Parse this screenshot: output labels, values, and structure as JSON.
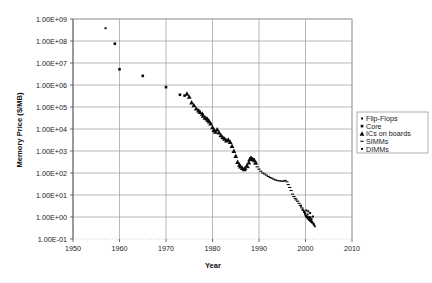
{
  "chart_data": {
    "type": "scatter",
    "title": "",
    "xlabel": "Year",
    "ylabel": "Memory Price ($/MB)",
    "xlim": [
      1950,
      2010
    ],
    "ylim": [
      0.1,
      1000000000
    ],
    "yscale": "log",
    "grid": true,
    "legend_position": "right",
    "x_ticks": [
      "1950",
      "1960",
      "1970",
      "1980",
      "1990",
      "2000",
      "2010"
    ],
    "x_tick_values": [
      1950,
      1960,
      1970,
      1980,
      1990,
      2000,
      2010
    ],
    "y_ticks": [
      "1.00E+09",
      "1.00E+08",
      "1.00E+07",
      "1.00E+06",
      "1.00E+05",
      "1.00E+04",
      "1.00E+03",
      "1.00E+02",
      "1.00E+01",
      "1.00E+00",
      "1.00E-01"
    ],
    "y_tick_values": [
      1000000000,
      100000000,
      10000000,
      1000000,
      100000,
      10000,
      1000,
      100,
      10,
      1,
      0.1
    ],
    "series": [
      {
        "name": "Flip-Flops",
        "marker": "small-square",
        "color": "#0a0a0a",
        "points": [
          [
            1957.0,
            380000000.0
          ]
        ]
      },
      {
        "name": "Core",
        "marker": "square",
        "color": "#0a0a0a",
        "points": [
          [
            1959.0,
            75000000.0
          ],
          [
            1960.0,
            5200000.0
          ],
          [
            1965.0,
            2600000.0
          ],
          [
            1970.0,
            800000.0
          ],
          [
            1973.0,
            360000.0
          ],
          [
            1974.0,
            330000.0
          ]
        ]
      },
      {
        "name": "ICs on boards",
        "marker": "triangle",
        "color": "#0a0a0a",
        "points": [
          [
            1974.5,
            400000.0
          ],
          [
            1975.0,
            290000.0
          ],
          [
            1975.5,
            160000.0
          ],
          [
            1976.0,
            120000.0
          ],
          [
            1976.5,
            85000.0
          ],
          [
            1977.0,
            70000.0
          ],
          [
            1977.3,
            60000.0
          ],
          [
            1977.8,
            50000.0
          ],
          [
            1978.0,
            40000.0
          ],
          [
            1978.4,
            33000.0
          ],
          [
            1978.8,
            30000.0
          ],
          [
            1979.0,
            26000.0
          ],
          [
            1979.3,
            22000.0
          ],
          [
            1979.6,
            18000.0
          ],
          [
            1980.0,
            12000.0
          ],
          [
            1980.3,
            9000.0
          ],
          [
            1980.6,
            7500.0
          ],
          [
            1981.0,
            9500.0
          ],
          [
            1981.4,
            7000.0
          ],
          [
            1981.8,
            5200.0
          ],
          [
            1982.2,
            4200.0
          ],
          [
            1982.6,
            3600.0
          ],
          [
            1983.0,
            3000.0
          ],
          [
            1983.4,
            3300.0
          ],
          [
            1983.8,
            2600.0
          ],
          [
            1984.2,
            1700.0
          ],
          [
            1984.6,
            1000.0
          ],
          [
            1985.0,
            600.0
          ],
          [
            1985.4,
            320.0
          ],
          [
            1985.8,
            240.0
          ],
          [
            1986.0,
            200.0
          ],
          [
            1986.4,
            170.0
          ],
          [
            1986.8,
            150.0
          ],
          [
            1987.0,
            165.0
          ],
          [
            1987.4,
            220.0
          ],
          [
            1987.8,
            300.0
          ],
          [
            1988.0,
            420.0
          ],
          [
            1988.3,
            500.0
          ],
          [
            1988.6,
            430.0
          ],
          [
            1989.0,
            380.0
          ],
          [
            1989.3,
            300.0
          ]
        ]
      },
      {
        "name": "SIMMs",
        "marker": "dash",
        "color": "#0a0a0a",
        "points": [
          [
            1987.6,
            175.0
          ],
          [
            1988.2,
            480.0
          ],
          [
            1988.8,
            440.0
          ],
          [
            1989.2,
            260.0
          ],
          [
            1989.6,
            190.0
          ],
          [
            1990.0,
            150.0
          ],
          [
            1990.4,
            120.0
          ],
          [
            1990.8,
            100.0
          ],
          [
            1991.2,
            90.0
          ],
          [
            1991.6,
            80.0
          ],
          [
            1992.0,
            70.0
          ],
          [
            1992.4,
            62.0
          ],
          [
            1992.8,
            58.0
          ],
          [
            1993.2,
            52.0
          ],
          [
            1993.6,
            48.0
          ],
          [
            1994.0,
            45.0
          ],
          [
            1994.4,
            44.0
          ],
          [
            1994.8,
            43.0
          ],
          [
            1995.2,
            42.0
          ],
          [
            1995.6,
            46.0
          ],
          [
            1996.0,
            40.0
          ],
          [
            1996.3,
            30.0
          ],
          [
            1996.6,
            22.0
          ],
          [
            1996.9,
            16.0
          ],
          [
            1997.2,
            11.0
          ],
          [
            1997.5,
            8.5
          ],
          [
            1997.8,
            7.0
          ],
          [
            1998.0,
            6.0
          ],
          [
            1998.3,
            5.2
          ],
          [
            1998.6,
            4.2
          ],
          [
            1998.9,
            3.4
          ],
          [
            1999.2,
            2.6
          ],
          [
            1999.5,
            2.0
          ],
          [
            1999.8,
            1.6
          ]
        ]
      },
      {
        "name": "DIMMs",
        "marker": "small-square",
        "color": "#0a0a0a",
        "points": [
          [
            1999.0,
            3.2
          ],
          [
            1999.4,
            2.2
          ],
          [
            1999.7,
            1.7
          ],
          [
            1999.9,
            1.4
          ],
          [
            2000.0,
            1.2
          ],
          [
            2000.1,
            1.1
          ],
          [
            2000.2,
            1.05
          ],
          [
            2000.3,
            1.0
          ],
          [
            2000.35,
            0.98
          ],
          [
            2000.4,
            0.95
          ],
          [
            2000.45,
            1.3
          ],
          [
            2000.5,
            0.9
          ],
          [
            2000.55,
            0.88
          ],
          [
            2000.6,
            0.85
          ],
          [
            2000.65,
            0.92
          ],
          [
            2000.7,
            0.8
          ],
          [
            2000.75,
            0.78
          ],
          [
            2000.8,
            0.76
          ],
          [
            2000.85,
            1.0
          ],
          [
            2000.9,
            0.74
          ],
          [
            2000.95,
            0.72
          ],
          [
            2001.0,
            0.7
          ],
          [
            2001.05,
            0.68
          ],
          [
            2001.1,
            0.95
          ],
          [
            2001.15,
            0.66
          ],
          [
            2001.2,
            0.64
          ],
          [
            2001.25,
            0.62
          ],
          [
            2001.3,
            0.8
          ],
          [
            2001.35,
            0.6
          ],
          [
            2001.4,
            0.58
          ],
          [
            2001.5,
            0.55
          ],
          [
            2001.6,
            1.05
          ],
          [
            2001.7,
            0.5
          ],
          [
            2001.8,
            0.45
          ],
          [
            2002.0,
            0.38
          ],
          [
            2000.2,
            2.0
          ],
          [
            2000.6,
            1.8
          ],
          [
            2001.0,
            1.5
          ]
        ]
      }
    ]
  },
  "legend": {
    "items": [
      {
        "label": "Flip-Flops",
        "marker": "small-square"
      },
      {
        "label": "Core",
        "marker": "square"
      },
      {
        "label": "ICs on boards",
        "marker": "triangle"
      },
      {
        "label": "SIMMs",
        "marker": "dash"
      },
      {
        "label": "DIMMs",
        "marker": "small-square"
      }
    ]
  },
  "colors": {
    "marker": "#0a0a0a",
    "gridline": "#9a9a9a",
    "axis": "#4a4a4a",
    "background": "#ffffff"
  }
}
